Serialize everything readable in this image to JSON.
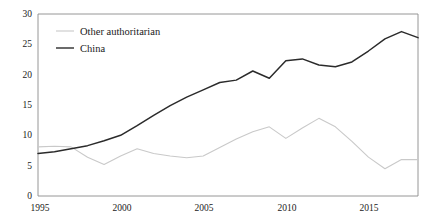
{
  "chart_data": {
    "type": "line",
    "title": "",
    "subtitle": "",
    "xlabel": "",
    "ylabel": "",
    "xlim": [
      1995,
      2018
    ],
    "ylim": [
      0,
      30
    ],
    "yticks": [
      0,
      5,
      10,
      15,
      20,
      25,
      30
    ],
    "xticks": [
      1995,
      2000,
      2005,
      2010,
      2015
    ],
    "xtick_labels": [
      "1995",
      "2000",
      "2005",
      "2010",
      "2015"
    ],
    "ytick_labels": [
      "0",
      "5",
      "10",
      "15",
      "20",
      "25",
      "30"
    ],
    "grid": false,
    "legend_position": "top-left",
    "x": [
      1995,
      1996,
      1997,
      1998,
      1999,
      2000,
      2001,
      2002,
      2003,
      2004,
      2005,
      2006,
      2007,
      2008,
      2009,
      2010,
      2011,
      2012,
      2013,
      2014,
      2015,
      2016,
      2017,
      2018
    ],
    "series": [
      {
        "name": "Other authoritarian",
        "color": "#c9c9c9",
        "values": [
          8.1,
          8.2,
          8.1,
          6.4,
          5.2,
          6.6,
          7.8,
          7.0,
          6.6,
          6.3,
          6.6,
          8.0,
          9.4,
          10.6,
          11.4,
          9.5,
          11.2,
          12.8,
          11.4,
          9.0,
          6.4,
          4.5,
          6.0,
          6.0
        ]
      },
      {
        "name": "China",
        "color": "#2b2b2b",
        "values": [
          7.0,
          7.3,
          7.8,
          8.3,
          9.1,
          10.0,
          11.6,
          13.3,
          14.9,
          16.3,
          17.5,
          18.7,
          19.1,
          20.6,
          19.4,
          22.3,
          22.6,
          21.6,
          21.3,
          22.1,
          23.9,
          25.9,
          27.1,
          26.1
        ]
      }
    ]
  },
  "legend": {
    "entries": [
      {
        "label": "Other authoritarian",
        "swatch": "line-swatch-light"
      },
      {
        "label": "China",
        "swatch": "line-swatch-dark"
      }
    ]
  },
  "axes": {
    "y_axis_name": "y-axis",
    "x_axis_name": "x-axis"
  }
}
